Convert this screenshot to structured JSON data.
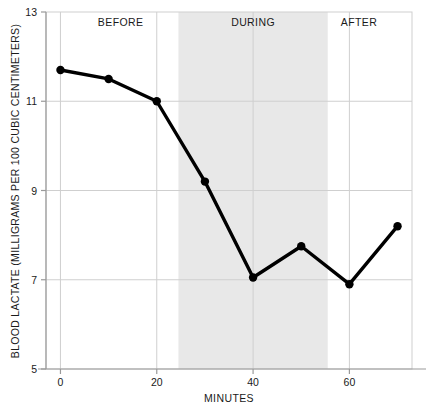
{
  "chart_data": {
    "type": "line",
    "title": "",
    "subtitle": "",
    "xlabel": "MINUTES",
    "ylabel": "BLOOD LACTATE (MILLIGRAMS PER 100 CUBIC CENTIMETERS)",
    "xlim": [
      -3,
      73
    ],
    "ylim": [
      5,
      13
    ],
    "xticks": [
      0,
      20,
      40,
      60
    ],
    "xtick_labels": [
      "0",
      "20",
      "40",
      "60"
    ],
    "yticks": [
      5,
      7,
      9,
      11,
      13
    ],
    "ytick_labels": [
      "5",
      "7",
      "9",
      "11",
      "13"
    ],
    "grid": true,
    "grid_color": "#cfcfcf",
    "legend": "none",
    "series": [
      {
        "name": "blood lactate",
        "x": [
          0,
          10,
          20,
          30,
          40,
          50,
          60,
          70
        ],
        "values": [
          11.7,
          11.5,
          11.0,
          9.2,
          7.05,
          7.75,
          6.9,
          8.2
        ],
        "line_color": "#000000",
        "marker": "circle",
        "marker_color": "#000000"
      }
    ],
    "shaded_regions": [
      {
        "label": "DURING",
        "x_start": 24.5,
        "x_end": 55.5,
        "color": "#e8e8e8"
      }
    ],
    "annotations": [
      {
        "text": "BEFORE",
        "x": 12.5,
        "y": 12.78
      },
      {
        "text": "DURING",
        "x": 40.0,
        "y": 12.78
      },
      {
        "text": "AFTER",
        "x": 62.0,
        "y": 12.78
      }
    ]
  },
  "figure": {
    "background_color": "#ffffff",
    "frame_color": "#cfcfcf",
    "axis_color": "#9a9a9a"
  }
}
